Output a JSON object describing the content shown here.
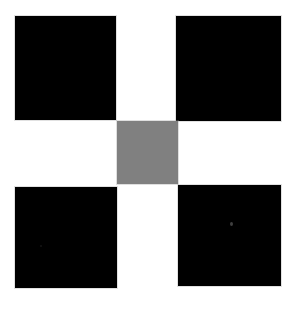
{
  "figure": {
    "width": 304,
    "height": 310,
    "background_color": "#ffffff"
  },
  "chart_data": {
    "type": "heatmap",
    "xlabel": "",
    "ylabel": "",
    "grid": false,
    "legend": "none",
    "colors": {
      "background": "#ffffff",
      "square": "#000000",
      "center_patch": "#808080",
      "edge_halo": "#aaaaaa"
    },
    "patches": [
      {
        "name": "top-left-square",
        "label": "Top left black square",
        "color": "#000000",
        "value": 0,
        "x": 15,
        "y": 16,
        "width": 101,
        "height": 104
      },
      {
        "name": "top-right-square",
        "label": "Top right black square",
        "color": "#000000",
        "value": 0,
        "x": 176,
        "y": 16,
        "width": 105,
        "height": 105
      },
      {
        "name": "center-square",
        "label": "Center gray patch",
        "color": "#808080",
        "value": 128,
        "x": 117,
        "y": 121,
        "width": 61,
        "height": 63
      },
      {
        "name": "bottom-left-square",
        "label": "Bottom left black square",
        "color": "#000000",
        "value": 0,
        "x": 15,
        "y": 187,
        "width": 102,
        "height": 101
      },
      {
        "name": "bottom-right-square",
        "label": "Bottom right black square",
        "color": "#000000",
        "value": 0,
        "x": 178,
        "y": 185,
        "width": 103,
        "height": 101
      }
    ],
    "artifacts": [
      {
        "name": "bright-speck",
        "x": 230,
        "y": 222,
        "note": "small light speck on bottom right square"
      },
      {
        "name": "faint-speck",
        "x": 40,
        "y": 245,
        "note": "faint dark speck on bottom left square"
      }
    ]
  }
}
